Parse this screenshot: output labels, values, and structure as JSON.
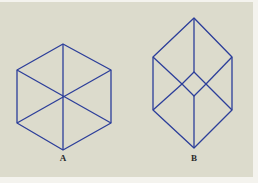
{
  "colors": {
    "background": "#dcdbcc",
    "line": "#2c3e9a",
    "label": "#2a2a2a",
    "margin": "#f4f3ee"
  },
  "figures": [
    {
      "id": "A",
      "label": "A",
      "description": "Regular hexagon with three diagonals through the center (ambiguous cube / star of lines)",
      "label_position": {
        "x": 63,
        "y": 154
      },
      "vertices": {
        "top": [
          63,
          44
        ],
        "upper_left": [
          17,
          70
        ],
        "upper_right": [
          111,
          70
        ],
        "lower_left": [
          17,
          123
        ],
        "lower_right": [
          111,
          123
        ],
        "bottom": [
          63,
          150
        ],
        "center": [
          63,
          97
        ]
      }
    },
    {
      "id": "B",
      "label": "B",
      "description": "Elongated hexagon (wireframe cube) with central small diamond where diagonals meet",
      "label_position": {
        "x": 194,
        "y": 154
      },
      "vertices": {
        "top": [
          194,
          18
        ],
        "upper_left": [
          153,
          57
        ],
        "upper_right": [
          232,
          57
        ],
        "lower_left": [
          153,
          110
        ],
        "lower_right": [
          232,
          110
        ],
        "bottom": [
          194,
          148
        ],
        "inner_top": [
          194,
          72
        ],
        "inner_left": [
          182,
          84
        ],
        "inner_right": [
          206,
          84
        ],
        "inner_bottom": [
          194,
          96
        ]
      }
    }
  ]
}
